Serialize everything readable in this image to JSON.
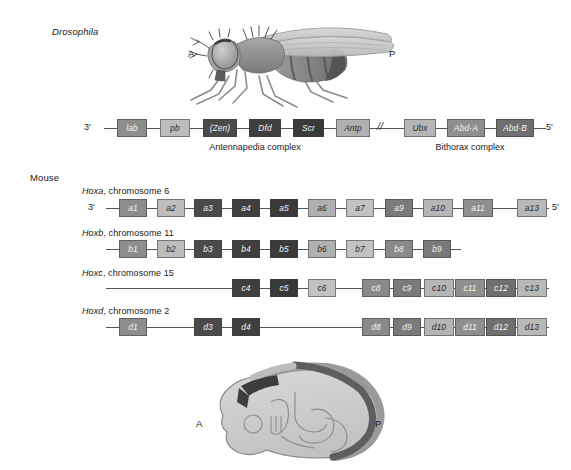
{
  "figure": {
    "background": "#ffffff",
    "drosophila_label": "Drosophila",
    "mouse_label": "Mouse"
  },
  "palette": {
    "pg1": "#8d8d8d",
    "pg2": "#bdbdbd",
    "pg3": "#4a4a4a",
    "pg4": "#3f3f3f",
    "pg5": "#3a3a3a",
    "pg6": "#b0b0b0",
    "pg7": "#c2c2c2",
    "pg8": "#8a8a8a",
    "pg9": "#7a7a7a",
    "pg10": "#b5b5b5",
    "pg11": "#8f8f8f",
    "pg12": "#6f6f6f",
    "pg13": "#b8b8b8",
    "line": "#555555"
  },
  "fly_panel": {
    "anterior_label": "A",
    "posterior_label": "P"
  },
  "embryo_panel": {
    "anterior_label": "A",
    "posterior_label": "P"
  },
  "drosophila_cluster": {
    "three_prime": "3′",
    "five_prime": "5′",
    "break_symbol": "//",
    "captions": [
      {
        "text": "Antennapedia complex"
      },
      {
        "text": "Bithorax complex"
      }
    ],
    "genes": [
      {
        "label": "lab",
        "fill": "#8d8d8d",
        "text": "dark"
      },
      {
        "label": "pb",
        "fill": "#bdbdbd",
        "text": "light"
      },
      {
        "label": "(Zen)",
        "fill": "#4a4a4a",
        "text": "dark"
      },
      {
        "label": "Dfd",
        "fill": "#3f3f3f",
        "text": "dark"
      },
      {
        "label": "Scr",
        "fill": "#3a3a3a",
        "text": "dark"
      },
      {
        "label": "Antp",
        "fill": "#b0b0b0",
        "text": "light"
      },
      {
        "label": "Ubx",
        "fill": "#b5b5b5",
        "text": "light"
      },
      {
        "label": "Abd-A",
        "fill": "#8f8f8f",
        "text": "dark"
      },
      {
        "label": "Abd-B",
        "fill": "#6f6f6f",
        "text": "dark"
      }
    ]
  },
  "mouse_clusters": [
    {
      "name": "Hoxa",
      "chromosome": "chromosome 6",
      "title_italic": "Hoxa",
      "title_rest": ", chromosome 6",
      "three_prime": "3′",
      "five_prime": "5′",
      "show_ends": true,
      "genes": [
        {
          "label": "a1",
          "fill": "#8d8d8d",
          "text": "dark"
        },
        {
          "label": "a2",
          "fill": "#bdbdbd",
          "text": "light"
        },
        {
          "label": "a3",
          "fill": "#4a4a4a",
          "text": "dark"
        },
        {
          "label": "a4",
          "fill": "#3f3f3f",
          "text": "dark"
        },
        {
          "label": "a5",
          "fill": "#3a3a3a",
          "text": "dark"
        },
        {
          "label": "a6",
          "fill": "#b0b0b0",
          "text": "light"
        },
        {
          "label": "a7",
          "fill": "#c2c2c2",
          "text": "light"
        },
        {
          "label": "a9",
          "fill": "#7a7a7a",
          "text": "dark"
        },
        {
          "label": "a10",
          "fill": "#b5b5b5",
          "text": "light"
        },
        {
          "label": "a11",
          "fill": "#8f8f8f",
          "text": "dark"
        },
        {
          "label": "a13",
          "fill": "#b8b8b8",
          "text": "light"
        }
      ]
    },
    {
      "name": "Hoxb",
      "chromosome": "chromosome 11",
      "title_italic": "Hoxb",
      "title_rest": ", chromosome 11",
      "three_prime": "",
      "five_prime": "",
      "show_ends": false,
      "genes": [
        {
          "label": "b1",
          "fill": "#8d8d8d",
          "text": "dark"
        },
        {
          "label": "b2",
          "fill": "#bdbdbd",
          "text": "light"
        },
        {
          "label": "b3",
          "fill": "#4a4a4a",
          "text": "dark"
        },
        {
          "label": "b4",
          "fill": "#3f3f3f",
          "text": "dark"
        },
        {
          "label": "b5",
          "fill": "#3a3a3a",
          "text": "dark"
        },
        {
          "label": "b6",
          "fill": "#b0b0b0",
          "text": "light"
        },
        {
          "label": "b7",
          "fill": "#c2c2c2",
          "text": "light"
        },
        {
          "label": "b8",
          "fill": "#8a8a8a",
          "text": "dark"
        },
        {
          "label": "b9",
          "fill": "#7a7a7a",
          "text": "dark"
        }
      ]
    },
    {
      "name": "Hoxc",
      "chromosome": "chromosome 15",
      "title_italic": "Hoxc",
      "title_rest": ", chromosome 15",
      "three_prime": "",
      "five_prime": "",
      "show_ends": false,
      "genes": [
        {
          "label": "c4",
          "fill": "#3f3f3f",
          "text": "dark"
        },
        {
          "label": "c5",
          "fill": "#3a3a3a",
          "text": "dark"
        },
        {
          "label": "c6",
          "fill": "#c2c2c2",
          "text": "light"
        },
        {
          "label": "c8",
          "fill": "#8a8a8a",
          "text": "dark"
        },
        {
          "label": "c9",
          "fill": "#7a7a7a",
          "text": "dark"
        },
        {
          "label": "c10",
          "fill": "#b5b5b5",
          "text": "light"
        },
        {
          "label": "c11",
          "fill": "#8f8f8f",
          "text": "dark"
        },
        {
          "label": "c12",
          "fill": "#6f6f6f",
          "text": "dark"
        },
        {
          "label": "c13",
          "fill": "#b8b8b8",
          "text": "light"
        }
      ]
    },
    {
      "name": "Hoxd",
      "chromosome": "chromosome 2",
      "title_italic": "Hoxd",
      "title_rest": ", chromosome 2",
      "three_prime": "",
      "five_prime": "",
      "show_ends": false,
      "genes": [
        {
          "label": "d1",
          "fill": "#8d8d8d",
          "text": "dark"
        },
        {
          "label": "d3",
          "fill": "#4a4a4a",
          "text": "dark"
        },
        {
          "label": "d4",
          "fill": "#3f3f3f",
          "text": "dark"
        },
        {
          "label": "d8",
          "fill": "#8a8a8a",
          "text": "dark"
        },
        {
          "label": "d9",
          "fill": "#7a7a7a",
          "text": "dark"
        },
        {
          "label": "d10",
          "fill": "#b5b5b5",
          "text": "light"
        },
        {
          "label": "d11",
          "fill": "#8f8f8f",
          "text": "dark"
        },
        {
          "label": "d12",
          "fill": "#6f6f6f",
          "text": "dark"
        },
        {
          "label": "d13",
          "fill": "#b8b8b8",
          "text": "light"
        }
      ]
    }
  ],
  "layout": {
    "drosophila_positions": [
      {
        "x": 117,
        "w": 30
      },
      {
        "x": 160,
        "w": 30
      },
      {
        "x": 203,
        "w": 34
      },
      {
        "x": 249,
        "w": 32
      },
      {
        "x": 293,
        "w": 31
      },
      {
        "x": 336,
        "w": 34
      },
      {
        "x": 404,
        "w": 32
      },
      {
        "x": 447,
        "w": 38
      },
      {
        "x": 496,
        "w": 38
      }
    ],
    "hoxa_positions": [
      {
        "x": 119,
        "w": 28
      },
      {
        "x": 157,
        "w": 28
      },
      {
        "x": 194,
        "w": 28
      },
      {
        "x": 232,
        "w": 28
      },
      {
        "x": 270,
        "w": 28
      },
      {
        "x": 308,
        "w": 28
      },
      {
        "x": 346,
        "w": 28
      },
      {
        "x": 385,
        "w": 28
      },
      {
        "x": 423,
        "w": 30
      },
      {
        "x": 463,
        "w": 30
      },
      {
        "x": 517,
        "w": 30
      }
    ],
    "hoxb_positions": [
      {
        "x": 119,
        "w": 28
      },
      {
        "x": 157,
        "w": 28
      },
      {
        "x": 194,
        "w": 28
      },
      {
        "x": 232,
        "w": 28
      },
      {
        "x": 270,
        "w": 28
      },
      {
        "x": 308,
        "w": 28
      },
      {
        "x": 346,
        "w": 28
      },
      {
        "x": 385,
        "w": 28
      },
      {
        "x": 423,
        "w": 28
      }
    ],
    "hoxc_positions": [
      {
        "x": 232,
        "w": 28
      },
      {
        "x": 270,
        "w": 28
      },
      {
        "x": 308,
        "w": 28
      },
      {
        "x": 385,
        "w": 28
      },
      {
        "x": 423,
        "w": 28
      },
      {
        "x": 461,
        "w": 30
      },
      {
        "x": 501,
        "w": 30
      },
      {
        "x": 0,
        "w": 0
      },
      {
        "x": 0,
        "w": 0
      }
    ]
  }
}
